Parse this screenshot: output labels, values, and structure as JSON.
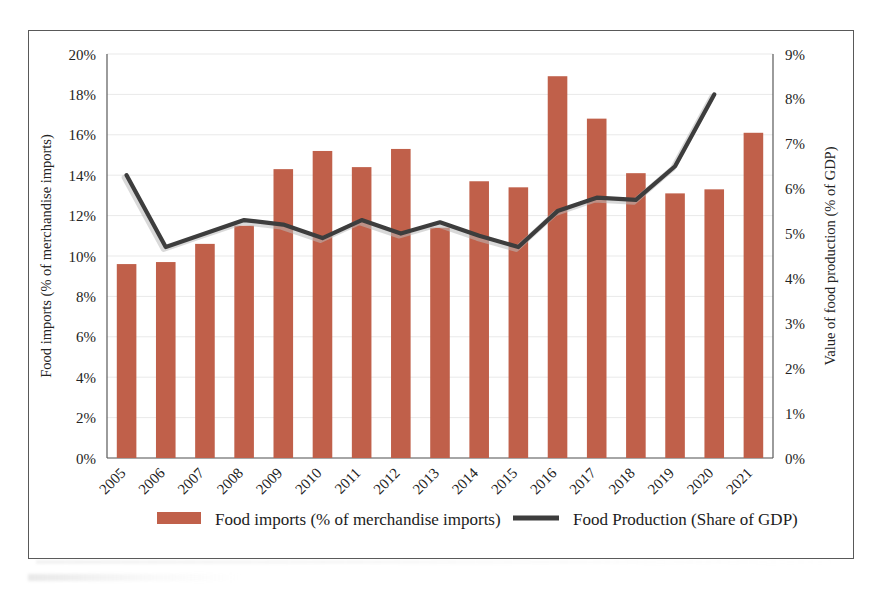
{
  "chart_data": {
    "type": "bar",
    "title": "",
    "subtitle": "",
    "categories": [
      "2005",
      "2006",
      "2007",
      "2008",
      "2009",
      "2010",
      "2011",
      "2012",
      "2013",
      "2014",
      "2015",
      "2016",
      "2017",
      "2018",
      "2019",
      "2020",
      "2021"
    ],
    "series": [
      {
        "name": "Food imports (% of merchandise imports)",
        "type": "bar",
        "axis": "left",
        "color": "#C0604A",
        "values": [
          9.6,
          9.7,
          10.6,
          11.5,
          14.3,
          15.2,
          14.4,
          15.3,
          11.4,
          13.7,
          13.4,
          18.9,
          16.8,
          14.1,
          13.1,
          13.3,
          16.1
        ]
      },
      {
        "name": "Food Production (Share of GDP)",
        "type": "line",
        "axis": "right",
        "color": "#3D3D3D",
        "values": [
          6.3,
          4.7,
          5.0,
          5.3,
          5.2,
          4.9,
          5.3,
          5.0,
          5.25,
          4.95,
          4.7,
          5.5,
          5.8,
          5.75,
          6.5,
          8.1,
          null
        ]
      }
    ],
    "left_axis": {
      "label": "Food imports (% of merchandise imports)",
      "ticks": [
        "0%",
        "2%",
        "4%",
        "6%",
        "8%",
        "10%",
        "12%",
        "14%",
        "16%",
        "18%",
        "20%"
      ],
      "min": 0,
      "max": 20,
      "step": 2
    },
    "right_axis": {
      "label": "Value of food production (% of GDP)",
      "ticks": [
        "0%",
        "1%",
        "2%",
        "3%",
        "4%",
        "5%",
        "6%",
        "7%",
        "8%",
        "9%"
      ],
      "min": 0,
      "max": 9,
      "step": 1
    },
    "xlabel": "",
    "grid": true,
    "legend_position": "bottom",
    "legend": [
      {
        "label": "Food imports (% of merchandise imports)",
        "marker": "bar-swatch",
        "color": "#C0604A"
      },
      {
        "label": "Food Production (Share of GDP)",
        "marker": "line-swatch",
        "color": "#3D3D3D"
      }
    ]
  },
  "figure": {
    "frame_color": "#595959",
    "background": "#ffffff"
  }
}
